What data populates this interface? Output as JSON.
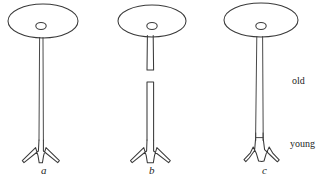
{
  "figure": {
    "title": "",
    "background_color": "#ffffff",
    "stroke_color": "#3a3a3a",
    "text_color": "#1f1f1f",
    "panels": [
      {
        "id": "panel-a",
        "label": "a",
        "label_x": 41,
        "label_y": 165,
        "stalk_type": "continuous-narrow",
        "cap": {
          "cx": 43,
          "cy": 21,
          "rx": 35,
          "ry": 17
        },
        "nucleus": {
          "cx": 41,
          "cy": 26,
          "rx": 5,
          "ry": 3.4
        }
      },
      {
        "id": "panel-b",
        "label": "b",
        "label_x": 149,
        "label_y": 165,
        "stalk_type": "broken-wide",
        "cap": {
          "cx": 152,
          "cy": 21,
          "rx": 34,
          "ry": 16
        },
        "nucleus": {
          "cx": 152,
          "cy": 26,
          "rx": 5,
          "ry": 3.4
        },
        "break_gap": {
          "top": 70,
          "bottom": 82
        }
      },
      {
        "id": "panel-c",
        "label": "c",
        "label_x": 262,
        "label_y": 165,
        "stalk_type": "continuous-wide-notched",
        "cap": {
          "cx": 261,
          "cy": 20,
          "rx": 37,
          "ry": 17
        },
        "nucleus": {
          "cx": 261,
          "cy": 26,
          "rx": 5,
          "ry": 3.4
        }
      }
    ],
    "age_labels": [
      {
        "id": "label-old",
        "text": "old",
        "x": 292,
        "y": 76
      },
      {
        "id": "label-young",
        "text": "young",
        "x": 290,
        "y": 139
      }
    ]
  }
}
